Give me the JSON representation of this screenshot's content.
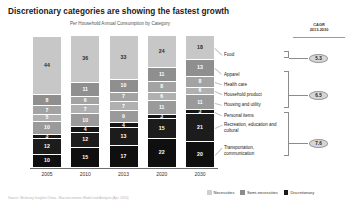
{
  "header": {
    "title": "Discretionary categories are showing the fastest growth",
    "subtitle": "Per Household Annual Consumption by Category"
  },
  "cagr": {
    "header_line1": "CAGR",
    "header_line2": "2013-2030",
    "values": [
      "5.3",
      "6.5",
      "7.6"
    ]
  },
  "legend": {
    "items": [
      {
        "label": "Necessities",
        "color": "#cfcfcf"
      },
      {
        "label": "Semi-necessities",
        "color": "#8c8c8c"
      },
      {
        "label": "Discretionary",
        "color": "#1a1a1a"
      }
    ]
  },
  "source": {
    "text": "Source: Mckinsey Insights China - Macroeconomic Model and Analysis (Apr. 2016)"
  },
  "chart_data": {
    "type": "bar",
    "title": "Discretionary categories are showing the fastest growth",
    "subtitle": "Per Household Annual Consumption by Category",
    "xlabel": "",
    "ylabel": "",
    "stacked": true,
    "unit": "percent",
    "grid": false,
    "legend_position": "bottom-right",
    "categories": [
      "2005",
      "2010",
      "2013",
      "2020",
      "2030"
    ],
    "series": [
      {
        "name": "Food",
        "group": "Necessities",
        "color": "#c7c7c7",
        "text_color": "#2a2a2a",
        "values": [
          44,
          36,
          33,
          24,
          18
        ]
      },
      {
        "name": "Apparel",
        "group": "Semi-necessities",
        "color": "#8f8f8f",
        "text_color": "#ffffff",
        "values": [
          8,
          11,
          10,
          11,
          13
        ]
      },
      {
        "name": "Health care",
        "group": "Semi-necessities",
        "color": "#a3a3a3",
        "text_color": "#ffffff",
        "values": [
          7,
          6,
          7,
          8,
          8
        ]
      },
      {
        "name": "Household product",
        "group": "Semi-necessities",
        "color": "#b0b0b0",
        "text_color": "#ffffff",
        "values": [
          5,
          7,
          7,
          6,
          6
        ]
      },
      {
        "name": "Housing and utility",
        "group": "Semi-necessities",
        "color": "#9a9a9a",
        "text_color": "#ffffff",
        "values": [
          10,
          10,
          9,
          11,
          11
        ]
      },
      {
        "name": "Personal items",
        "group": "Discretionary",
        "color": "#151515",
        "text_color": "#ffffff",
        "values": [
          3,
          4,
          4,
          3,
          3
        ]
      },
      {
        "name": "Recreation, education and cultural",
        "group": "Discretionary",
        "color": "#1c1c1c",
        "text_color": "#ffffff",
        "values": [
          12,
          12,
          13,
          15,
          21
        ]
      },
      {
        "name": "Transportation, communication",
        "group": "Discretionary",
        "color": "#0f0f0f",
        "text_color": "#ffffff",
        "values": [
          10,
          15,
          17,
          22,
          20
        ]
      }
    ],
    "annotations": {
      "cagr_label": "CAGR 2013-2030",
      "cagr_necessities": "5.3",
      "cagr_semi_necessities": "6.5",
      "cagr_discretionary": "7.6"
    }
  }
}
